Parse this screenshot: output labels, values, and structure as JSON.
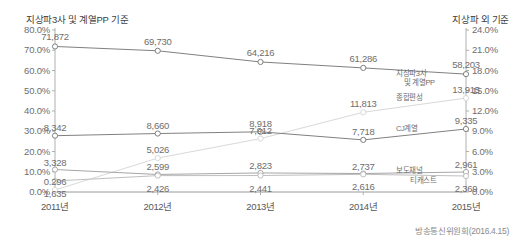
{
  "chart_data": {
    "type": "line",
    "title": "",
    "left_axis_title": "지상파3사 및 계열PP 기준",
    "right_axis_title": "지상파 외 기준",
    "xlabel": "",
    "categories": [
      "2011년",
      "2012년",
      "2013년",
      "2014년",
      "2015년"
    ],
    "left_ticks": [
      "0.0%",
      "10.0%",
      "20.0%",
      "30.0%",
      "40.0%",
      "50.0%",
      "60.0%",
      "70.0%",
      "80.0%"
    ],
    "left_tick_values": [
      0,
      10,
      20,
      30,
      40,
      50,
      60,
      70,
      80
    ],
    "ylim_left": [
      0,
      80
    ],
    "right_ticks": [
      "0.0%",
      "3.0%",
      "6.0%",
      "9.0%",
      "12.0%",
      "15.0%",
      "18.0%",
      "21.0%",
      "24.0%"
    ],
    "right_tick_values": [
      0,
      3,
      6,
      9,
      12,
      15,
      18,
      21,
      24
    ],
    "ylim_right": [
      0,
      24
    ],
    "grid": false,
    "legend": "right-inline",
    "series": [
      {
        "name": "지상파3사 및 계열PP",
        "axis": "left",
        "color": "#808080",
        "values": [
          71.872,
          69.73,
          64.216,
          61.286,
          58.203
        ],
        "labels": [
          "71,872",
          "69,730",
          "64,216",
          "61,286",
          "58,203"
        ]
      },
      {
        "name": "종합편성",
        "axis": "right",
        "color": "#d9d9d9",
        "values": [
          0.296,
          5.026,
          7.912,
          11.813,
          13.915
        ],
        "labels": [
          "0.296",
          "5,026",
          "7,912",
          "11,813",
          "13,915"
        ]
      },
      {
        "name": "CJ계열",
        "axis": "right",
        "color": "#808080",
        "values": [
          8.342,
          8.66,
          8.918,
          7.718,
          9.335
        ],
        "labels": [
          "8,342",
          "8,660",
          "8,918",
          "7,718",
          "9,335"
        ]
      },
      {
        "name": "보도채널",
        "axis": "right",
        "color": "#a6a6a6",
        "values": [
          3.328,
          2.599,
          2.823,
          2.737,
          2.961
        ],
        "labels": [
          "3,328",
          "2,599",
          "2,823",
          "2,737",
          "2,961"
        ]
      },
      {
        "name": "티캐스트",
        "axis": "right",
        "color": "#bfbfbf",
        "values": [
          1.635,
          2.426,
          2.441,
          2.616,
          2.369
        ],
        "labels": [
          "1,635",
          "2,426",
          "2,441",
          "2,616",
          "2,369"
        ]
      }
    ],
    "source": "방송통신위원회(2016.4.15)"
  },
  "source_note": "방송통신위원회(2016.4.15)"
}
